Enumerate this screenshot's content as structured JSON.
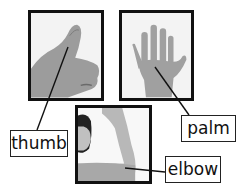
{
  "diagram": {
    "photos": [
      {
        "id": "thumb-photo",
        "subject": "hand with thumb raised"
      },
      {
        "id": "palm-photo",
        "subject": "open hand showing palm"
      },
      {
        "id": "elbow-photo",
        "subject": "child with raised bent arm"
      }
    ],
    "labels": {
      "thumb": "thumb",
      "palm": "palm",
      "elbow": "elbow"
    },
    "colors": {
      "border": "#111111",
      "background": "#ffffff",
      "photo_bg": "#f2f2f2",
      "skin_gray": "#9a9a9a"
    }
  }
}
